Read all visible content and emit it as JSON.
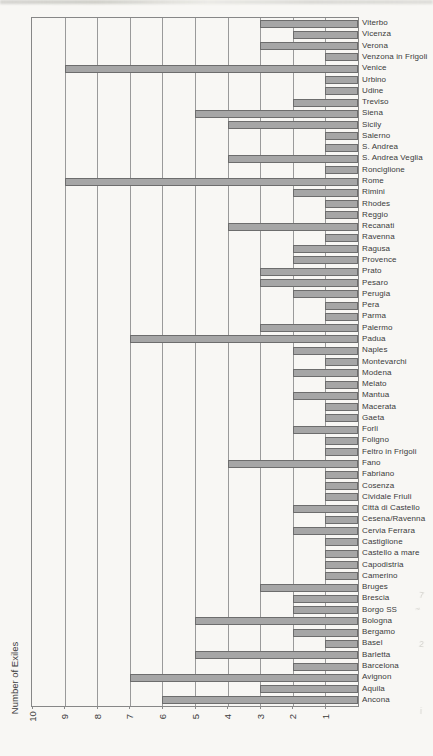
{
  "page": {
    "margin_marks": [
      "7",
      "~",
      "2",
      "i"
    ]
  },
  "chart_data": {
    "type": "bar",
    "orientation": "horizontal, page rotated 90 degrees (value axis at bottom of scan, categories listed on right)",
    "title": "",
    "ylabel": "Number of Exiles",
    "value_axis_ticks": [
      10,
      9,
      8,
      7,
      6,
      5,
      4,
      3,
      2,
      1
    ],
    "value_axis_range": [
      0,
      10
    ],
    "grid": true,
    "categories": [
      "Viterbo",
      "Vicenza",
      "Verona",
      "Venzona in Frigoli",
      "Venice",
      "Urbino",
      "Udine",
      "Treviso",
      "Siena",
      "Sicily",
      "Salerno",
      "S. Andrea",
      "S. Andrea Veglia",
      "Ronciglione",
      "Rome",
      "Rimini",
      "Rhodes",
      "Reggio",
      "Recanati",
      "Ravenna",
      "Ragusa",
      "Provence",
      "Prato",
      "Pesaro",
      "Perugia",
      "Pera",
      "Parma",
      "Palermo",
      "Padua",
      "Naples",
      "Montevarchi",
      "Modena",
      "Melato",
      "Mantua",
      "Macerata",
      "Gaeta",
      "Forli",
      "Foligno",
      "Feltro in Frigoli",
      "Fano",
      "Fabriano",
      "Cosenza",
      "Cividale Friuli",
      "Città di Castello",
      "Cesena/Ravenna",
      "Cervia Ferrara",
      "Castiglione",
      "Castello a mare",
      "Capodistria",
      "Camerino",
      "Bruges",
      "Brescia",
      "Borgo SS",
      "Bologna",
      "Bergamo",
      "Basel",
      "Barletta",
      "Barcelona",
      "Avignon",
      "Aquila",
      "Ancona"
    ],
    "values": [
      3,
      2,
      3,
      1,
      9,
      1,
      1,
      2,
      5,
      4,
      1,
      1,
      4,
      1,
      9,
      2,
      1,
      1,
      4,
      1,
      2,
      2,
      3,
      3,
      2,
      1,
      1,
      3,
      7,
      2,
      1,
      2,
      1,
      2,
      1,
      1,
      2,
      1,
      1,
      4,
      1,
      1,
      1,
      2,
      1,
      2,
      1,
      1,
      1,
      1,
      3,
      2,
      2,
      5,
      2,
      1,
      5,
      2,
      7,
      3,
      6
    ],
    "colors": {
      "bar_fill": "#a6a6a6",
      "bar_border": "#6d6d6d",
      "gridline": "#9a9a9a",
      "plot_border": "#878787",
      "text": "#3b3b3b",
      "paper": "#f8f7f4"
    }
  }
}
